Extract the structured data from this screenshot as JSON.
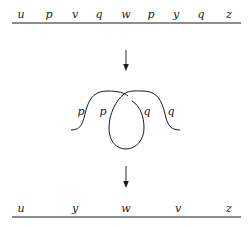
{
  "top_row": {
    "labels": [
      "u",
      "p",
      "v",
      "q",
      "w",
      "p",
      "y",
      "q",
      "z"
    ],
    "x_positions": [
      21,
      49,
      75,
      99,
      126,
      151,
      176,
      201,
      229
    ]
  },
  "middle_figure": {
    "labels": [
      {
        "text": "p",
        "x": 81,
        "y": 115
      },
      {
        "text": "p",
        "x": 103,
        "y": 115
      },
      {
        "text": "q",
        "x": 146,
        "y": 115
      },
      {
        "text": "q",
        "x": 170,
        "y": 115
      }
    ]
  },
  "bottom_row": {
    "labels": [
      "u",
      "y",
      "w",
      "v",
      "z"
    ],
    "x_positions": [
      21,
      75,
      126,
      178,
      229
    ]
  },
  "arrows": [
    "down-arrow-1",
    "down-arrow-2"
  ]
}
